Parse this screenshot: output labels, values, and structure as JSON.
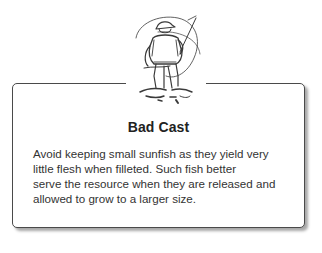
{
  "sidebar": {
    "illustration": "fisherman-casting-icon",
    "title": "Bad Cast",
    "body_lines": [
      "Avoid keeping small sunfish as they yield very",
      "little flesh when filleted. Such fish better",
      "serve the resource when they are released and",
      "allowed to grow to a larger size."
    ]
  },
  "colors": {
    "border": "#4a4a4a",
    "title": "#222222",
    "text": "#333333",
    "background": "#ffffff"
  }
}
